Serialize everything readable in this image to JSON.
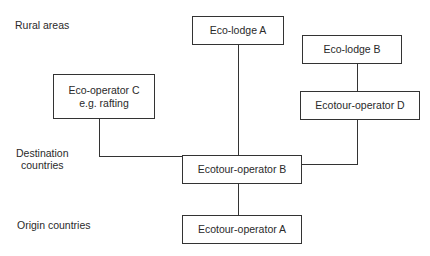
{
  "levels": {
    "rural": "Rural areas",
    "destination_1": "Destination",
    "destination_2": "countries",
    "origin": "Origin countries"
  },
  "nodes": {
    "eco_lodge_a": "Eco-lodge A",
    "eco_lodge_b": "Eco-lodge B",
    "eco_operator_c_1": "Eco-operator C",
    "eco_operator_c_2": "e.g. rafting",
    "ecotour_operator_d": "Ecotour-operator D",
    "ecotour_operator_b": "Ecotour-operator B",
    "ecotour_operator_a": "Ecotour-operator A"
  },
  "edges": [
    [
      "Eco-lodge A",
      "Ecotour-operator B"
    ],
    [
      "Eco-lodge B",
      "Ecotour-operator D"
    ],
    [
      "Ecotour-operator D",
      "Ecotour-operator B"
    ],
    [
      "Eco-operator C",
      "Ecotour-operator B"
    ],
    [
      "Ecotour-operator B",
      "Ecotour-operator A"
    ]
  ]
}
